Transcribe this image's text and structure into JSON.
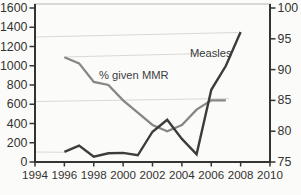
{
  "chart_data": {
    "type": "line",
    "title": "",
    "x_axis": {
      "label": "",
      "min": 1994,
      "max": 2010,
      "tick_step": 2,
      "ticks": [
        1994,
        1996,
        1998,
        2000,
        2002,
        2004,
        2006,
        2008,
        2010
      ]
    },
    "y_left_axis": {
      "label": "",
      "min": 0,
      "max": 1600,
      "tick_step": 200,
      "ticks": [
        0,
        200,
        400,
        600,
        800,
        1000,
        1200,
        1400,
        1600
      ]
    },
    "y_right_axis": {
      "label": "",
      "min": 75,
      "max": 100,
      "tick_step": 5,
      "ticks": [
        75,
        80,
        85,
        90,
        95,
        100
      ]
    },
    "grid": false,
    "legend_position": "inline-annotations",
    "series": [
      {
        "name": "% given MMR",
        "axis": "right",
        "color": "#878785",
        "stroke_width": 2.3,
        "x": [
          1996,
          1997,
          1998,
          1999,
          2000,
          2001,
          2002,
          2003,
          2004,
          2005,
          2006,
          2007
        ],
        "values": [
          92,
          91,
          88,
          87.5,
          85,
          83,
          81,
          80,
          81,
          83.5,
          85,
          85
        ]
      },
      {
        "name": "Measles",
        "axis": "left",
        "color": "#3c3c3c",
        "stroke_width": 2.4,
        "x": [
          1996,
          1997,
          1998,
          1999,
          2000,
          2001,
          2002,
          2003,
          2004,
          2005,
          2006,
          2007,
          2008
        ],
        "values": [
          105,
          170,
          55,
          90,
          95,
          70,
          315,
          440,
          240,
          80,
          750,
          1000,
          1350
        ]
      }
    ],
    "annotations": [
      {
        "text": "% given MMR",
        "x_px": 99,
        "baseline_y_px": 79,
        "font_px": 11.2,
        "color": "#3f3f3f"
      },
      {
        "text": "Measles",
        "x_px": 190,
        "baseline_y_px": 57,
        "font_px": 11.2,
        "color": "#383838"
      }
    ],
    "style": {
      "axis_color": "#343434",
      "tick_label_color": "#333331",
      "frame_top_color": "#b8b8b6",
      "background": "#fbfbf9",
      "artifact_line_color": "#d9d9d6",
      "side_tick_font_px": 12.4,
      "bottom_tick_font_px": 11.6
    },
    "scan_artifact_lines_px": [
      {
        "x1": 35,
        "y1": 37,
        "x2": 238,
        "y2": 32.5
      },
      {
        "x1": 64,
        "y1": 57,
        "x2": 205,
        "y2": 53.5
      },
      {
        "x1": 35,
        "y1": 101.5,
        "x2": 229,
        "y2": 98.5
      },
      {
        "x1": 35,
        "y1": 152,
        "x2": 64,
        "y2": 152.3
      }
    ],
    "layout": {
      "plot_px": {
        "left": 35,
        "right": 270,
        "top": 8,
        "bottom": 162,
        "frame_top": 4
      }
    }
  }
}
